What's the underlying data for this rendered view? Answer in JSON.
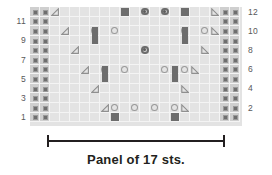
{
  "chart_data": {
    "type": "table",
    "title": "Panel of 17 sts.",
    "grid": {
      "columns": 21,
      "rows": 12,
      "cell_width": 10,
      "cell_height": 9.6
    },
    "row_numbers_left": [
      "11",
      "9",
      "7",
      "5",
      "3",
      "1"
    ],
    "row_numbers_right": [
      "12",
      "10",
      "8",
      "6",
      "4",
      "2"
    ],
    "legend_symbols": [
      {
        "name": "purl-dot",
        "meaning": "purl stitch / seed border"
      },
      {
        "name": "dark-square",
        "meaning": "dark slipped or knot stitch"
      },
      {
        "name": "dark-bar",
        "meaning": "two-row dark cable column"
      },
      {
        "name": "open-circle",
        "meaning": "yarn over"
      },
      {
        "name": "circle-with-dot",
        "meaning": "bobble"
      },
      {
        "name": "left-triangle",
        "meaning": "left-leaning decrease"
      },
      {
        "name": "right-triangle",
        "meaning": "right-leaning decrease"
      }
    ],
    "border_columns": {
      "left": [
        0,
        1
      ],
      "right": [
        19,
        20
      ]
    },
    "cells": [
      {
        "row": 12,
        "col": 2,
        "symbol": "left-triangle"
      },
      {
        "row": 12,
        "col": 9,
        "symbol": "dark-square"
      },
      {
        "row": 12,
        "col": 11,
        "symbol": "circle-with-dot"
      },
      {
        "row": 12,
        "col": 13,
        "symbol": "circle-with-dot"
      },
      {
        "row": 12,
        "col": 15,
        "symbol": "dark-square"
      },
      {
        "row": 12,
        "col": 18,
        "symbol": "right-triangle"
      },
      {
        "row": 10,
        "col": 3,
        "symbol": "left-triangle"
      },
      {
        "row": 10,
        "col": 6,
        "symbol": "open-circle"
      },
      {
        "row": 10,
        "col": 8,
        "symbol": "open-circle"
      },
      {
        "row": 10,
        "col": 15,
        "symbol": "open-circle"
      },
      {
        "row": 10,
        "col": 17,
        "symbol": "open-circle"
      },
      {
        "row": 10,
        "col": 18,
        "symbol": "right-triangle"
      },
      {
        "row": 9,
        "col": 6,
        "symbol": "dark-bar"
      },
      {
        "row": 9,
        "col": 15,
        "symbol": "dark-bar"
      },
      {
        "row": 8,
        "col": 4,
        "symbol": "left-triangle"
      },
      {
        "row": 8,
        "col": 11,
        "symbol": "circle-with-dot"
      },
      {
        "row": 8,
        "col": 17,
        "symbol": "right-triangle"
      },
      {
        "row": 6,
        "col": 5,
        "symbol": "left-triangle"
      },
      {
        "row": 6,
        "col": 7,
        "symbol": "open-circle"
      },
      {
        "row": 6,
        "col": 9,
        "symbol": "open-circle"
      },
      {
        "row": 6,
        "col": 13,
        "symbol": "open-circle"
      },
      {
        "row": 6,
        "col": 15,
        "symbol": "open-circle"
      },
      {
        "row": 6,
        "col": 16,
        "symbol": "right-triangle"
      },
      {
        "row": 5,
        "col": 7,
        "symbol": "dark-bar"
      },
      {
        "row": 5,
        "col": 14,
        "symbol": "dark-bar"
      },
      {
        "row": 4,
        "col": 6,
        "symbol": "left-triangle"
      },
      {
        "row": 4,
        "col": 15,
        "symbol": "right-triangle"
      },
      {
        "row": 2,
        "col": 7,
        "symbol": "left-triangle"
      },
      {
        "row": 2,
        "col": 8,
        "symbol": "open-circle"
      },
      {
        "row": 2,
        "col": 10,
        "symbol": "open-circle"
      },
      {
        "row": 2,
        "col": 12,
        "symbol": "open-circle"
      },
      {
        "row": 2,
        "col": 14,
        "symbol": "open-circle"
      },
      {
        "row": 2,
        "col": 15,
        "symbol": "right-triangle"
      },
      {
        "row": 1,
        "col": 8,
        "symbol": "dark-square"
      },
      {
        "row": 1,
        "col": 14,
        "symbol": "dark-square"
      }
    ],
    "colors": {
      "grid_background": "#e3e3e3",
      "grid_line": "#f4f4f4",
      "border_cell": "#cfcfcf",
      "symbol_dark": "#6d6d6d",
      "symbol_outline": "#9b9b9b",
      "text": "#58585a",
      "bracket": "#231f20"
    }
  },
  "caption": {
    "text": "Panel of 17 sts."
  },
  "bracket": {
    "label": "panel-width-bracket"
  }
}
